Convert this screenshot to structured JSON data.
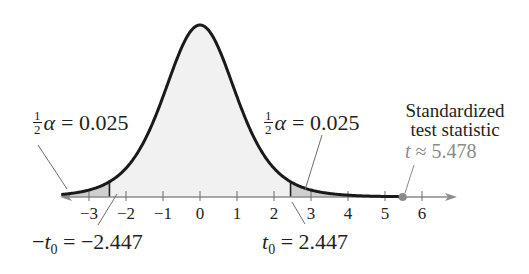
{
  "chart_data": {
    "type": "area",
    "title": "",
    "distribution": "t",
    "degrees_of_freedom": 6,
    "xlabel": "t",
    "ylabel": "",
    "xlim": [
      -3.8,
      6.9
    ],
    "x_ticks": [
      -3,
      -2,
      -1,
      0,
      1,
      2,
      3,
      4,
      5,
      6
    ],
    "x_tick_labels": [
      "−3",
      "−2",
      "−1",
      "0",
      "1",
      "2",
      "3",
      "4",
      "5",
      "6"
    ],
    "grid": false,
    "rejection_regions": [
      {
        "side": "left",
        "from": -3.8,
        "to": -2.447,
        "area": 0.025
      },
      {
        "side": "right",
        "from": 2.447,
        "to": 6.9,
        "area": 0.025
      }
    ],
    "critical_values": [
      -2.447,
      2.447
    ],
    "test_statistic": 5.478,
    "annotations": [
      {
        "text": "½α = 0.025",
        "points_to": "left rejection region"
      },
      {
        "text": "½α = 0.025",
        "points_to": "right rejection region"
      },
      {
        "text": "−t0 = −2.447",
        "points_to": -2.447
      },
      {
        "text": "t0 = 2.447",
        "points_to": 2.447
      },
      {
        "text": "Standardized test statistic t ≈ 5.478",
        "points_to": 5.478
      }
    ],
    "colors": {
      "curve": "#1a1a1a",
      "fill_center": "#f0f0f0",
      "fill_tails": "#cfcfcf",
      "axis": "#8c8c8c",
      "test_stat": "#8a8a8a"
    }
  },
  "labels": {
    "ticks": [
      "−3",
      "−2",
      "−1",
      "0",
      "1",
      "2",
      "3",
      "4",
      "5",
      "6"
    ],
    "left_alpha": {
      "num": "1",
      "den": "2",
      "greek": "α",
      "value": "= 0.025"
    },
    "right_alpha": {
      "num": "1",
      "den": "2",
      "greek": "α",
      "value": "= 0.025"
    },
    "left_crit": {
      "minus": "−",
      "var": "t",
      "sub": "0",
      "value": " = −2.447"
    },
    "right_crit": {
      "var": "t",
      "sub": "0",
      "value": " = 2.447"
    },
    "stat": {
      "line1": "Standardized",
      "line2": "test statistic",
      "var": "t",
      "value": " ≈ 5.478"
    }
  }
}
